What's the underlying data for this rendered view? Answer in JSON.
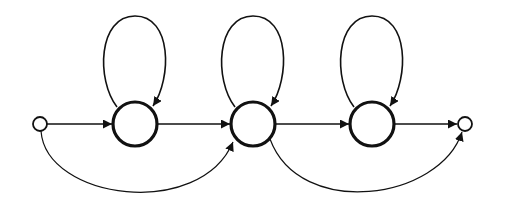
{
  "diagram": {
    "type": "state-transition-diagram",
    "colors": {
      "stroke": "#111111",
      "background": "#ffffff"
    },
    "nodes": [
      {
        "id": "start",
        "kind": "terminal",
        "cx": 40,
        "cy": 124,
        "r": 7
      },
      {
        "id": "s1",
        "kind": "state",
        "cx": 135,
        "cy": 124,
        "r": 22
      },
      {
        "id": "s2",
        "kind": "state",
        "cx": 253,
        "cy": 124,
        "r": 22
      },
      {
        "id": "s3",
        "kind": "state",
        "cx": 372,
        "cy": 124,
        "r": 22
      },
      {
        "id": "end",
        "kind": "terminal",
        "cx": 465,
        "cy": 124,
        "r": 7
      }
    ],
    "edges": [
      {
        "from": "start",
        "to": "s1",
        "kind": "forward"
      },
      {
        "from": "s1",
        "to": "s2",
        "kind": "forward"
      },
      {
        "from": "s2",
        "to": "s3",
        "kind": "forward"
      },
      {
        "from": "s3",
        "to": "end",
        "kind": "forward"
      },
      {
        "from": "s1",
        "to": "s1",
        "kind": "self-loop"
      },
      {
        "from": "s2",
        "to": "s2",
        "kind": "self-loop"
      },
      {
        "from": "s3",
        "to": "s3",
        "kind": "self-loop"
      },
      {
        "from": "start",
        "to": "s2",
        "kind": "skip"
      },
      {
        "from": "s2",
        "to": "end",
        "kind": "skip"
      }
    ]
  }
}
